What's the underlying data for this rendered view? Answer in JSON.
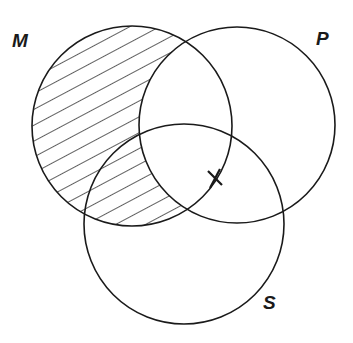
{
  "diagram": {
    "type": "venn-3",
    "circles": [
      {
        "id": "M",
        "label": "M",
        "cx": 132,
        "cy": 126,
        "r": 100,
        "label_x": 12,
        "label_y": 30
      },
      {
        "id": "P",
        "label": "P",
        "cx": 237,
        "cy": 125,
        "r": 98,
        "label_x": 316,
        "label_y": 28
      },
      {
        "id": "S",
        "label": "S",
        "cx": 184,
        "cy": 224,
        "r": 100,
        "label_x": 263,
        "label_y": 292
      }
    ],
    "shaded_region": "M minus P (hatched)",
    "marks": [
      {
        "type": "x-mark",
        "on": "boundary of M between P and S",
        "x": 215,
        "y": 178
      }
    ],
    "stroke_color": "#1a1a1a",
    "background": "#ffffff"
  }
}
